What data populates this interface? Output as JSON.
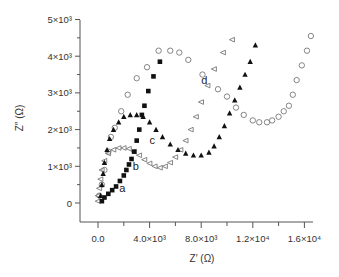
{
  "chart_data": {
    "type": "scatter",
    "title": "",
    "xlabel": "Z′ (Ω)",
    "ylabel": "Z″ (Ω)",
    "xlim": [
      -1500,
      17000
    ],
    "ylim": [
      -500,
      5200
    ],
    "grid": false,
    "legend": "none (curves labeled inline a, b, c, d)",
    "x_ticks": [
      {
        "value": 0,
        "label": "0.0"
      },
      {
        "value": 4000,
        "label": "4.0×10³"
      },
      {
        "value": 8000,
        "label": "8.0×10³"
      },
      {
        "value": 12000,
        "label": "1.2×10⁴"
      },
      {
        "value": 16000,
        "label": "1.6×10⁴"
      }
    ],
    "x_minor_ticks": [
      2000,
      6000,
      10000,
      14000
    ],
    "y_ticks": [
      {
        "value": 0,
        "label": "0"
      },
      {
        "value": 1000,
        "label": "1×10³"
      },
      {
        "value": 2000,
        "label": "2×10³"
      },
      {
        "value": 3000,
        "label": "3×10³"
      },
      {
        "value": 4000,
        "label": "4×10³"
      },
      {
        "value": 5000,
        "label": "5×10³"
      }
    ],
    "y_minor_ticks": [
      500,
      1500,
      2500,
      3500,
      4500
    ],
    "series": [
      {
        "name": "a",
        "marker": "filled-square",
        "label_pos": [
          1650,
          300
        ],
        "points": [
          [
            300,
            50
          ],
          [
            500,
            150
          ],
          [
            800,
            250
          ],
          [
            1100,
            350
          ],
          [
            1400,
            450
          ],
          [
            1700,
            600
          ],
          [
            2000,
            750
          ],
          [
            2200,
            900
          ],
          [
            2400,
            1050
          ],
          [
            2600,
            1200
          ],
          [
            2800,
            1400
          ],
          [
            3000,
            1700
          ],
          [
            3200,
            2000
          ],
          [
            3400,
            2400
          ],
          [
            3600,
            2650
          ],
          [
            3900,
            3050
          ],
          [
            4300,
            3450
          ],
          [
            4800,
            3850
          ]
        ]
      },
      {
        "name": "b",
        "marker": "open-triangle-left",
        "label_pos": [
          2700,
          900
        ],
        "points": [
          [
            0,
            50
          ],
          [
            0,
            200
          ],
          [
            100,
            400
          ],
          [
            200,
            650
          ],
          [
            300,
            900
          ],
          [
            500,
            1150
          ],
          [
            800,
            1350
          ],
          [
            1200,
            1450
          ],
          [
            1600,
            1500
          ],
          [
            2000,
            1500
          ],
          [
            2400,
            1480
          ],
          [
            2800,
            1400
          ],
          [
            3200,
            1300
          ],
          [
            3600,
            1180
          ],
          [
            4000,
            1080
          ],
          [
            4400,
            1000
          ],
          [
            4800,
            960
          ],
          [
            5200,
            1000
          ],
          [
            5600,
            1100
          ],
          [
            6000,
            1250
          ],
          [
            6400,
            1450
          ],
          [
            6800,
            1700
          ],
          [
            7200,
            2000
          ],
          [
            7600,
            2350
          ],
          [
            8000,
            2750
          ],
          [
            8500,
            3200
          ],
          [
            9000,
            3650
          ],
          [
            9700,
            4100
          ],
          [
            10400,
            4450
          ]
        ]
      },
      {
        "name": "c",
        "marker": "filled-triangle",
        "label_pos": [
          4000,
          1600
        ],
        "points": [
          [
            200,
            200
          ],
          [
            300,
            500
          ],
          [
            400,
            800
          ],
          [
            500,
            1100
          ],
          [
            700,
            1450
          ],
          [
            900,
            1750
          ],
          [
            1200,
            2000
          ],
          [
            1600,
            2200
          ],
          [
            2000,
            2350
          ],
          [
            2500,
            2400
          ],
          [
            3000,
            2400
          ],
          [
            3500,
            2350
          ],
          [
            4000,
            2200
          ],
          [
            4500,
            2000
          ],
          [
            5000,
            1800
          ],
          [
            5600,
            1600
          ],
          [
            6200,
            1450
          ],
          [
            6800,
            1350
          ],
          [
            7400,
            1300
          ],
          [
            8000,
            1300
          ],
          [
            8600,
            1380
          ],
          [
            9000,
            1550
          ],
          [
            9400,
            1800
          ],
          [
            9800,
            2100
          ],
          [
            10200,
            2450
          ],
          [
            10600,
            2800
          ],
          [
            11000,
            3150
          ],
          [
            11400,
            3500
          ],
          [
            11800,
            3850
          ],
          [
            12200,
            4300
          ]
        ]
      },
      {
        "name": "d",
        "marker": "open-circle",
        "label_pos": [
          8000,
          3250
        ],
        "points": [
          [
            100,
            200
          ],
          [
            300,
            500
          ],
          [
            500,
            900
          ],
          [
            800,
            1400
          ],
          [
            1000,
            1800
          ],
          [
            1300,
            2050
          ],
          [
            1800,
            2500
          ],
          [
            2300,
            2950
          ],
          [
            3000,
            3400
          ],
          [
            3800,
            3700
          ],
          [
            4700,
            4150
          ],
          [
            5600,
            4150
          ],
          [
            6300,
            4100
          ],
          [
            7000,
            3900
          ],
          [
            8100,
            3500
          ],
          [
            9300,
            3100
          ],
          [
            10000,
            2900
          ],
          [
            10700,
            2600
          ],
          [
            11300,
            2400
          ],
          [
            12000,
            2250
          ],
          [
            12500,
            2200
          ],
          [
            13100,
            2200
          ],
          [
            13500,
            2250
          ],
          [
            14000,
            2350
          ],
          [
            14400,
            2500
          ],
          [
            14800,
            2650
          ],
          [
            15100,
            2950
          ],
          [
            15400,
            3350
          ],
          [
            15800,
            3750
          ],
          [
            16200,
            4150
          ],
          [
            16500,
            4550
          ]
        ]
      }
    ]
  },
  "labels": {
    "xlabel": "Z′ (Ω)",
    "ylabel": "Z″ (Ω)"
  }
}
